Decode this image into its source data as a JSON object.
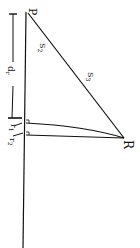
{
  "diagram": {
    "points": {
      "P": {
        "label": "P",
        "x": 29,
        "y": 6
      },
      "R": {
        "label": "R",
        "x": 124,
        "y": 144
      }
    },
    "labels": {
      "hyp_upper": "S",
      "hyp_upper_sub": "2",
      "hyp_lower": "S",
      "hyp_lower_sub": "3",
      "dim": "d",
      "dim_sub": "r",
      "r1": "r",
      "r1_sub": "1",
      "r2": "r",
      "r2_sub": "2"
    },
    "colors": {
      "ink": "#111111",
      "background": "#ffffff"
    }
  }
}
